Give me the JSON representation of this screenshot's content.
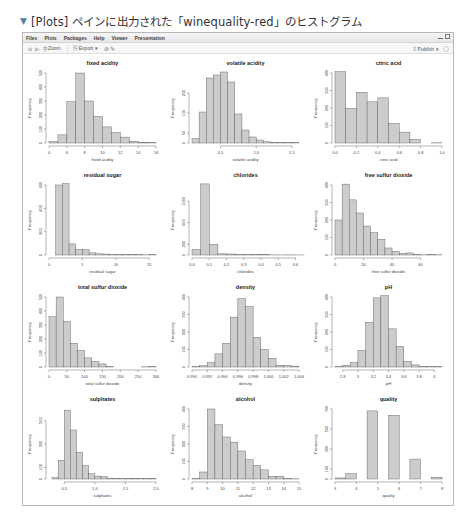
{
  "caption": {
    "marker": "▼",
    "text": "[Plots] ペインに出力された「winequality-red」のヒストグラム"
  },
  "menubar": {
    "items": [
      "Files",
      "Plots",
      "Packages",
      "Help",
      "Viewer",
      "Presentation"
    ]
  },
  "toolbar": {
    "back_icon": "◀",
    "forward_icon": "▶",
    "zoom_label": "Zoom",
    "export_label": "Export",
    "export_caret": "▾",
    "remove_icon": "⊘",
    "brush_icon": "✎",
    "publish_label": "Publish",
    "publish_caret": "▾"
  },
  "style": {
    "bar_fill": "#cccccc",
    "bar_stroke": "#555555",
    "axis_color": "#444444"
  },
  "chart_data": [
    {
      "type": "bar",
      "title": "fixed acidity",
      "xlabel": "fixed acidity",
      "ylabel": "Frequency",
      "bins": [
        [
          4,
          5,
          10
        ],
        [
          5,
          6,
          58
        ],
        [
          6,
          7,
          295
        ],
        [
          7,
          8,
          500
        ],
        [
          8,
          9,
          300
        ],
        [
          9,
          10,
          190
        ],
        [
          10,
          11,
          115
        ],
        [
          11,
          12,
          75
        ],
        [
          12,
          13,
          42
        ],
        [
          13,
          14,
          12
        ],
        [
          14,
          15,
          5
        ],
        [
          15,
          16,
          3
        ]
      ],
      "xlim": [
        4,
        16
      ],
      "xticks": [
        4,
        6,
        8,
        10,
        12,
        14,
        16
      ],
      "ylim": [
        0,
        500
      ],
      "yticks": [
        0,
        100,
        200,
        300,
        400,
        500
      ]
    },
    {
      "type": "bar",
      "title": "volatile acidity",
      "xlabel": "volatile acidity",
      "ylabel": "Frequency",
      "bins": [
        [
          0.1,
          0.2,
          22
        ],
        [
          0.2,
          0.3,
          155
        ],
        [
          0.3,
          0.4,
          325
        ],
        [
          0.4,
          0.5,
          340
        ],
        [
          0.5,
          0.6,
          355
        ],
        [
          0.6,
          0.7,
          305
        ],
        [
          0.7,
          0.8,
          145
        ],
        [
          0.8,
          0.9,
          65
        ],
        [
          0.9,
          1.0,
          30
        ],
        [
          1.0,
          1.1,
          15
        ],
        [
          1.1,
          1.2,
          6
        ],
        [
          1.2,
          1.3,
          3
        ],
        [
          1.3,
          1.4,
          2
        ],
        [
          1.4,
          1.5,
          2
        ],
        [
          1.5,
          1.6,
          2
        ]
      ],
      "xlim": [
        0.1,
        1.6
      ],
      "xticks": [
        0.5,
        1.0,
        1.5
      ],
      "ylim": [
        0,
        350
      ],
      "yticks": [
        0,
        50,
        150,
        250
      ]
    },
    {
      "type": "bar",
      "title": "citric acid",
      "xlabel": "citric acid",
      "ylabel": "Frequency",
      "bins": [
        [
          0.0,
          0.1,
          420
        ],
        [
          0.1,
          0.2,
          198
        ],
        [
          0.2,
          0.3,
          290
        ],
        [
          0.3,
          0.4,
          235
        ],
        [
          0.4,
          0.5,
          258
        ],
        [
          0.5,
          0.6,
          112
        ],
        [
          0.6,
          0.7,
          62
        ],
        [
          0.7,
          0.8,
          20
        ],
        [
          0.8,
          0.9,
          0
        ],
        [
          0.9,
          1.0,
          1
        ]
      ],
      "xlim": [
        0.0,
        1.0
      ],
      "xticks": [
        0.0,
        0.2,
        0.4,
        0.6,
        0.8,
        1.0
      ],
      "ylim": [
        0,
        400
      ],
      "yticks": [
        0,
        100,
        200,
        300,
        400
      ]
    },
    {
      "type": "bar",
      "title": "residual sugar",
      "xlabel": "residual sugar",
      "ylabel": "Frequency",
      "bins": [
        [
          1,
          2,
          600
        ],
        [
          2,
          3,
          760
        ],
        [
          3,
          4,
          95
        ],
        [
          4,
          5,
          48
        ],
        [
          5,
          6,
          45
        ],
        [
          6,
          7,
          18
        ],
        [
          7,
          8,
          10
        ],
        [
          8,
          9,
          8
        ],
        [
          9,
          10,
          3
        ],
        [
          10,
          11,
          3
        ],
        [
          11,
          12,
          2
        ],
        [
          12,
          13,
          2
        ],
        [
          13,
          14,
          4
        ],
        [
          14,
          15,
          1
        ],
        [
          15,
          16,
          2
        ]
      ],
      "xlim": [
        0,
        16
      ],
      "xticks": [
        0,
        5,
        10,
        15
      ],
      "ylim": [
        0,
        600
      ],
      "yticks": [
        0,
        200,
        400,
        600
      ]
    },
    {
      "type": "bar",
      "title": "chlorides",
      "xlabel": "chlorides",
      "ylabel": "Frequency",
      "bins": [
        [
          0.0,
          0.05,
          105
        ],
        [
          0.05,
          0.1,
          1320
        ],
        [
          0.1,
          0.15,
          200
        ],
        [
          0.15,
          0.2,
          22
        ],
        [
          0.2,
          0.25,
          18
        ],
        [
          0.25,
          0.3,
          8
        ],
        [
          0.3,
          0.35,
          6
        ],
        [
          0.35,
          0.4,
          8
        ],
        [
          0.4,
          0.45,
          10
        ],
        [
          0.45,
          0.5,
          2
        ],
        [
          0.5,
          0.55,
          1
        ],
        [
          0.55,
          0.6,
          2
        ],
        [
          0.6,
          0.65,
          1
        ]
      ],
      "xlim": [
        0.0,
        0.62
      ],
      "xticks": [
        0.0,
        0.1,
        0.2,
        0.3,
        0.4,
        0.5,
        0.6
      ],
      "ylim": [
        0,
        1300
      ],
      "yticks": [
        0,
        200,
        600,
        1000
      ]
    },
    {
      "type": "bar",
      "title": "free sulfur dioxide",
      "xlabel": "free sulfur dioxide",
      "ylabel": "Frequency",
      "bins": [
        [
          0,
          5,
          200
        ],
        [
          5,
          10,
          405
        ],
        [
          10,
          15,
          315
        ],
        [
          15,
          20,
          240
        ],
        [
          20,
          25,
          165
        ],
        [
          25,
          30,
          128
        ],
        [
          30,
          35,
          90
        ],
        [
          35,
          40,
          40
        ],
        [
          40,
          45,
          20
        ],
        [
          45,
          50,
          10
        ],
        [
          50,
          55,
          12
        ],
        [
          55,
          60,
          3
        ],
        [
          60,
          65,
          1
        ],
        [
          65,
          70,
          4
        ],
        [
          70,
          75,
          1
        ]
      ],
      "xlim": [
        0,
        75
      ],
      "xticks": [
        0,
        20,
        40,
        60
      ],
      "ylim": [
        0,
        400
      ],
      "yticks": [
        0,
        100,
        200,
        300,
        400
      ]
    },
    {
      "type": "bar",
      "title": "total sulfur dioxide",
      "xlabel": "total sulfur dioxide",
      "ylabel": "Frequency",
      "bins": [
        [
          0,
          20,
          360
        ],
        [
          20,
          40,
          500
        ],
        [
          40,
          60,
          325
        ],
        [
          60,
          80,
          170
        ],
        [
          80,
          100,
          118
        ],
        [
          100,
          120,
          65
        ],
        [
          120,
          140,
          40
        ],
        [
          140,
          160,
          22
        ],
        [
          160,
          180,
          2
        ],
        [
          180,
          200,
          0
        ],
        [
          200,
          220,
          0
        ],
        [
          220,
          240,
          0
        ],
        [
          260,
          280,
          1
        ],
        [
          280,
          300,
          2
        ]
      ],
      "xlim": [
        0,
        300
      ],
      "xticks": [
        0,
        50,
        100,
        150,
        200,
        250,
        300
      ],
      "ylim": [
        0,
        500
      ],
      "yticks": [
        0,
        100,
        200,
        300,
        400,
        500
      ]
    },
    {
      "type": "bar",
      "title": "density",
      "xlabel": "density",
      "ylabel": "Frequency",
      "bins": [
        [
          0.99,
          0.991,
          3
        ],
        [
          0.991,
          0.992,
          8
        ],
        [
          0.992,
          0.993,
          25
        ],
        [
          0.993,
          0.994,
          75
        ],
        [
          0.994,
          0.995,
          135
        ],
        [
          0.995,
          0.996,
          285
        ],
        [
          0.996,
          0.997,
          390
        ],
        [
          0.997,
          0.998,
          345
        ],
        [
          0.998,
          0.999,
          170
        ],
        [
          0.999,
          1.0,
          100
        ],
        [
          1.0,
          1.001,
          50
        ],
        [
          1.001,
          1.002,
          10
        ],
        [
          1.002,
          1.003,
          8
        ],
        [
          1.003,
          1.004,
          5
        ]
      ],
      "xlim": [
        0.99,
        1.004
      ],
      "xticks": [
        0.99,
        0.992,
        0.994,
        0.996,
        0.998,
        1.0,
        1.002,
        1.004
      ],
      "ylim": [
        0,
        400
      ],
      "yticks": [
        0,
        100,
        200,
        300,
        400
      ]
    },
    {
      "type": "bar",
      "title": "pH",
      "xlabel": "pH",
      "ylabel": "Frequency",
      "bins": [
        [
          2.7,
          2.8,
          2
        ],
        [
          2.8,
          2.9,
          10
        ],
        [
          2.9,
          3.0,
          25
        ],
        [
          3.0,
          3.1,
          95
        ],
        [
          3.1,
          3.2,
          255
        ],
        [
          3.2,
          3.3,
          395
        ],
        [
          3.3,
          3.4,
          420
        ],
        [
          3.4,
          3.5,
          218
        ],
        [
          3.5,
          3.6,
          118
        ],
        [
          3.6,
          3.7,
          32
        ],
        [
          3.7,
          3.8,
          12
        ],
        [
          3.8,
          3.9,
          3
        ],
        [
          3.9,
          4.0,
          2
        ],
        [
          4.0,
          4.1,
          2
        ]
      ],
      "xlim": [
        2.7,
        4.1
      ],
      "xticks": [
        2.8,
        3.0,
        3.2,
        3.4,
        3.6,
        3.8,
        4.0
      ],
      "ylim": [
        0,
        400
      ],
      "yticks": [
        0,
        100,
        200,
        300,
        400
      ]
    },
    {
      "type": "bar",
      "title": "sulphates",
      "xlabel": "sulphates",
      "ylabel": "Frequency",
      "bins": [
        [
          0.3,
          0.4,
          12
        ],
        [
          0.4,
          0.5,
          160
        ],
        [
          0.5,
          0.6,
          590
        ],
        [
          0.6,
          0.7,
          420
        ],
        [
          0.7,
          0.8,
          230
        ],
        [
          0.8,
          0.9,
          115
        ],
        [
          0.9,
          1.0,
          45
        ],
        [
          1.0,
          1.1,
          25
        ],
        [
          1.1,
          1.2,
          20
        ],
        [
          1.2,
          1.3,
          8
        ],
        [
          1.3,
          1.4,
          5
        ],
        [
          1.4,
          1.5,
          3
        ],
        [
          1.5,
          1.6,
          5
        ],
        [
          1.6,
          1.7,
          3
        ],
        [
          1.7,
          1.8,
          2
        ],
        [
          1.8,
          1.9,
          3
        ],
        [
          1.9,
          2.0,
          5
        ]
      ],
      "xlim": [
        0.25,
        2.0
      ],
      "xticks": [
        0.5,
        1.0,
        1.5,
        2.0
      ],
      "ylim": [
        0,
        600
      ],
      "yticks": [
        0,
        100,
        300,
        500
      ]
    },
    {
      "type": "bar",
      "title": "alcohol",
      "xlabel": "alcohol",
      "ylabel": "Frequency",
      "bins": [
        [
          8,
          8.5,
          2
        ],
        [
          8.5,
          9,
          40
        ],
        [
          9,
          9.5,
          400
        ],
        [
          9.5,
          10,
          310
        ],
        [
          10,
          10.5,
          240
        ],
        [
          10.5,
          11,
          210
        ],
        [
          11,
          11.5,
          160
        ],
        [
          11.5,
          12,
          110
        ],
        [
          12,
          12.5,
          78
        ],
        [
          12.5,
          13,
          52
        ],
        [
          13,
          13.5,
          15
        ],
        [
          13.5,
          14,
          16
        ],
        [
          14,
          14.5,
          4
        ],
        [
          14.5,
          15,
          1
        ]
      ],
      "xlim": [
        8,
        15
      ],
      "xticks": [
        8,
        9,
        10,
        11,
        12,
        13,
        14,
        15
      ],
      "ylim": [
        0,
        400
      ],
      "yticks": [
        0,
        100,
        200,
        300,
        400
      ]
    },
    {
      "type": "bar",
      "title": "quality",
      "xlabel": "quality",
      "ylabel": "Frequency",
      "bins": [
        [
          3,
          3.5,
          10
        ],
        [
          3.5,
          4,
          53
        ],
        [
          4,
          4.5,
          0
        ],
        [
          4.5,
          5,
          681
        ],
        [
          5,
          5.5,
          0
        ],
        [
          5.5,
          6,
          638
        ],
        [
          6,
          6.5,
          0
        ],
        [
          6.5,
          7,
          199
        ],
        [
          7,
          7.5,
          0
        ],
        [
          7.5,
          8,
          18
        ]
      ],
      "xlim": [
        3,
        8
      ],
      "xticks": [
        3,
        4,
        5,
        6,
        7,
        8
      ],
      "ylim": [
        0,
        700
      ],
      "yticks": [
        0,
        100,
        300,
        500,
        700
      ]
    }
  ]
}
